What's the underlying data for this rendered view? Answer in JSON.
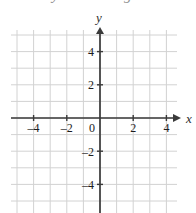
{
  "figure": {
    "kind": "coordinate-plane",
    "background_color": "#ffffff",
    "grid_color": "#d2d2d2",
    "axis_color": "#3a3a3a",
    "label_color": "#1c1c1c"
  },
  "top_remnant": {
    "note": "partially cropped descenders of a text line above the figure",
    "fragment_a": "u",
    "fragment_b": "y",
    "fragment_c": "g"
  },
  "axis_labels": {
    "x": "x",
    "y": "y"
  },
  "chart_data": {
    "type": "scatter",
    "title": "",
    "subtitle": "",
    "xlabel": "x",
    "ylabel": "y",
    "xlim": [
      -5,
      5
    ],
    "ylim": [
      -5,
      5
    ],
    "x_ticks": [
      -4,
      -2,
      0,
      2,
      4
    ],
    "y_ticks": [
      4,
      2,
      -2,
      -4
    ],
    "x_tick_labels": [
      "–4",
      "–2",
      "0",
      "2",
      "4"
    ],
    "y_tick_labels": [
      "4",
      "2",
      "–2",
      "–4"
    ],
    "origin_label": "0",
    "grid": true,
    "grid_step": 1,
    "legend": null,
    "legend_position": "none",
    "series": [],
    "annotations": [],
    "axis_arrows": {
      "x_positive": true,
      "y_positive": true
    }
  }
}
